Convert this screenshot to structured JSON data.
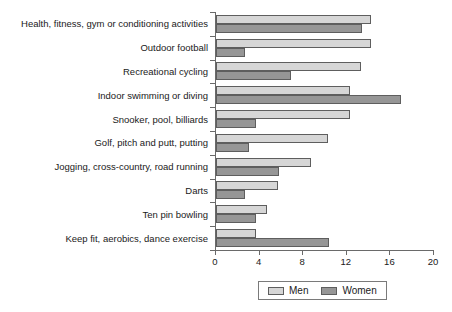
{
  "chart_data": {
    "type": "bar",
    "orientation": "horizontal",
    "title": "",
    "xlabel": "",
    "ylabel": "",
    "xlim": [
      0,
      20
    ],
    "xticks": [
      0,
      4,
      8,
      12,
      16,
      20
    ],
    "grid": false,
    "legend_position": "bottom",
    "categories": [
      "Health, fitness, gym or conditioning activities",
      "Outdoor football",
      "Recreational cycling",
      "Indoor swimming or diving",
      "Snooker, pool, billiards",
      "Golf, pitch and putt, putting",
      "Jogging, cross-country, road running",
      "Darts",
      "Ten pin bowling",
      "Keep fit, aerobics, dance exercise"
    ],
    "series": [
      {
        "name": "Men",
        "color": "#d6d6d6",
        "values": [
          14.2,
          14.2,
          13.3,
          12.3,
          12.3,
          10.3,
          8.7,
          5.7,
          4.7,
          3.7
        ]
      },
      {
        "name": "Women",
        "color": "#969696",
        "values": [
          13.4,
          2.7,
          6.9,
          17.0,
          3.7,
          3.0,
          5.8,
          2.7,
          3.7,
          10.4
        ]
      }
    ]
  }
}
